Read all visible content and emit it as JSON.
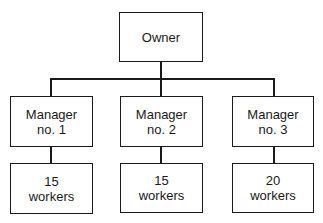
{
  "diagram": {
    "type": "org-chart",
    "root": {
      "label": "Owner"
    },
    "managers": [
      {
        "line1": "Manager",
        "line2": "no. 1",
        "workers_count": "15",
        "workers_label": "workers"
      },
      {
        "line1": "Manager",
        "line2": "no. 2",
        "workers_count": "15",
        "workers_label": "workers"
      },
      {
        "line1": "Manager",
        "line2": "no. 3",
        "workers_count": "20",
        "workers_label": "workers"
      }
    ]
  }
}
